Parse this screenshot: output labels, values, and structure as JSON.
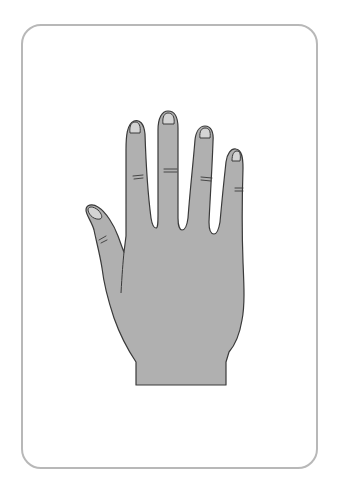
{
  "illustration": {
    "subject": "hand-back-view",
    "label": "Hand",
    "fingers": [
      "thumb",
      "index",
      "middle",
      "ring",
      "pinky"
    ]
  },
  "colors": {
    "background": "#ffffff",
    "card_border": "#b8b8b8",
    "skin_fill": "#b0b0b0",
    "outline": "#3a3a3a",
    "nail_fill": "#d4d4d4"
  }
}
